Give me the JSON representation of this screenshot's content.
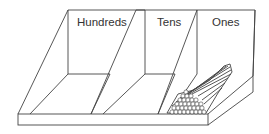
{
  "diagram": {
    "type": "place-value-tray",
    "sections": [
      {
        "label": "Hundreds"
      },
      {
        "label": "Tens"
      },
      {
        "label": "Ones"
      }
    ],
    "contents": {
      "ones": "bundle of sticks"
    },
    "colors": {
      "line": "#444444",
      "background": "#ffffff",
      "text": "#333333"
    }
  }
}
